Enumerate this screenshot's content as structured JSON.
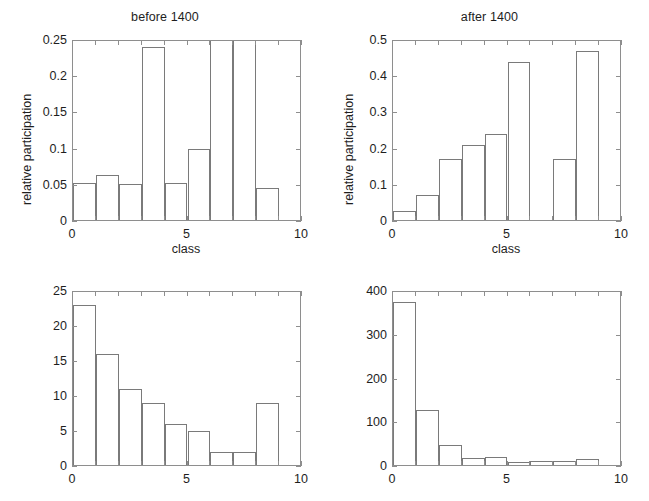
{
  "figure": {
    "background": "#ffffff",
    "axis_color": "#8e8e8e",
    "bar_edge_color": "#7a7a7a",
    "text_color": "#1e1e1e"
  },
  "panels": {
    "top_left": {
      "id": "before-1400-relative"
    },
    "top_right": {
      "id": "after-1400-relative"
    },
    "bottom_left": {
      "id": "before-1400-counts"
    },
    "bottom_right": {
      "id": "after-1400-counts"
    }
  },
  "chart_data": [
    {
      "type": "bar",
      "panel": "top-left",
      "title": "before 1400",
      "xlabel": "class",
      "ylabel": "relative participation",
      "xlim": [
        0,
        10
      ],
      "ylim": [
        0,
        0.25
      ],
      "xticks": [
        0,
        5,
        10
      ],
      "xtick_labels": [
        "0",
        "5",
        "10"
      ],
      "yticks": [
        0,
        0.05,
        0.1,
        0.15,
        0.2,
        0.25
      ],
      "ytick_labels": [
        "0",
        "0.05",
        "0.1",
        "0.15",
        "0.2",
        "0.25"
      ],
      "grid": false,
      "legend": null,
      "bar_width": 1,
      "categories": [
        0,
        1,
        2,
        3,
        4,
        5,
        6,
        7,
        8
      ],
      "values": [
        0.052,
        0.064,
        0.051,
        0.24,
        0.052,
        0.1,
        0.25,
        0.25,
        0.045
      ],
      "notes": "bars at class 6 and 7 are clipped at the top of the axis (value at or above 0.25)"
    },
    {
      "type": "bar",
      "panel": "top-right",
      "title": "after 1400",
      "xlabel": "class",
      "ylabel": "relative participation",
      "xlim": [
        0,
        10
      ],
      "ylim": [
        0,
        0.5
      ],
      "xticks": [
        0,
        5,
        10
      ],
      "xtick_labels": [
        "0",
        "5",
        "10"
      ],
      "yticks": [
        0,
        0.1,
        0.2,
        0.3,
        0.4,
        0.5
      ],
      "ytick_labels": [
        "0",
        "0.1",
        "0.2",
        "0.3",
        "0.4",
        "0.5"
      ],
      "grid": false,
      "legend": null,
      "bar_width": 1,
      "categories": [
        0,
        1,
        2,
        3,
        4,
        5,
        6,
        7,
        8
      ],
      "values": [
        0.029,
        0.072,
        0.17,
        0.21,
        0.24,
        0.44,
        0.0,
        0.17,
        0.47
      ]
    },
    {
      "type": "bar",
      "panel": "bottom-left",
      "title": "",
      "xlabel": "",
      "ylabel": "",
      "xlim": [
        0,
        10
      ],
      "ylim": [
        0,
        25
      ],
      "xticks": [
        0,
        5,
        10
      ],
      "xtick_labels": [
        "0",
        "5",
        "10"
      ],
      "yticks": [
        0,
        5,
        10,
        15,
        20,
        25
      ],
      "ytick_labels": [
        "0",
        "5",
        "10",
        "15",
        "20",
        "25"
      ],
      "grid": false,
      "legend": null,
      "bar_width": 1,
      "categories": [
        0,
        1,
        2,
        3,
        4,
        5,
        6,
        7,
        8
      ],
      "values": [
        23,
        16,
        11,
        9,
        6,
        5,
        2,
        2,
        9
      ]
    },
    {
      "type": "bar",
      "panel": "bottom-right",
      "title": "",
      "xlabel": "",
      "ylabel": "",
      "xlim": [
        0,
        10
      ],
      "ylim": [
        0,
        400
      ],
      "xticks": [
        0,
        5,
        10
      ],
      "xtick_labels": [
        "0",
        "5",
        "10"
      ],
      "yticks": [
        0,
        100,
        200,
        300,
        400
      ],
      "ytick_labels": [
        "0",
        "100",
        "200",
        "300",
        "400"
      ],
      "grid": false,
      "legend": null,
      "bar_width": 1,
      "categories": [
        0,
        1,
        2,
        3,
        4,
        5,
        6,
        7,
        8
      ],
      "values": [
        375,
        128,
        47,
        18,
        21,
        9,
        11,
        12,
        17
      ]
    }
  ]
}
